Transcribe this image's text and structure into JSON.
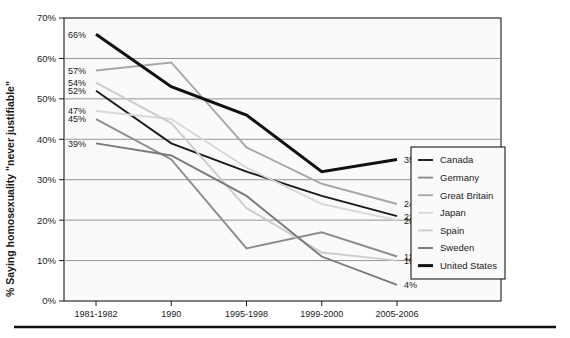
{
  "chart_data": {
    "type": "line",
    "title": "",
    "xlabel": "",
    "ylabel": "% Saying homosexuality \"never justifiable\"",
    "categories": [
      "1981-1982",
      "1990",
      "1995-1998",
      "1999-2000",
      "2005-2006"
    ],
    "ylim": [
      0,
      70
    ],
    "ytick_labels": [
      "0%",
      "10%",
      "20%",
      "30%",
      "40%",
      "50%",
      "60%",
      "70%"
    ],
    "ytick_values": [
      0,
      10,
      20,
      30,
      40,
      50,
      60,
      70
    ],
    "grid": true,
    "legend_position": "right-inside",
    "series": [
      {
        "name": "Canada",
        "color": "#1a1a1a",
        "width": 1.9,
        "values": [
          52,
          39,
          32,
          26,
          21
        ],
        "start_label": "52%",
        "end_label": "21%"
      },
      {
        "name": "Germany",
        "color": "#8c8c8c",
        "width": 1.9,
        "values": [
          45,
          35,
          13,
          17,
          11
        ],
        "start_label": "45%",
        "end_label": "11%"
      },
      {
        "name": "Great Britain",
        "color": "#a8a8a8",
        "width": 1.9,
        "values": [
          57,
          59,
          38,
          29,
          24
        ],
        "start_label": "57%",
        "end_label": "24%"
      },
      {
        "name": "Japan",
        "color": "#d8d8d8",
        "width": 1.9,
        "values": [
          47,
          45,
          33,
          24,
          20
        ],
        "start_label": "47%",
        "end_label": "20%"
      },
      {
        "name": "Spain",
        "color": "#cccccc",
        "width": 1.9,
        "values": [
          54,
          44,
          23,
          12,
          10
        ],
        "start_label": "54%",
        "end_label": "10%"
      },
      {
        "name": "Sweden",
        "color": "#7a7a7a",
        "width": 1.9,
        "values": [
          39,
          36,
          26,
          11,
          4
        ],
        "start_label": "39%",
        "end_label": "4%"
      },
      {
        "name": "United States",
        "color": "#111111",
        "width": 3.0,
        "values": [
          66,
          53,
          46,
          32,
          35
        ],
        "start_label": "66%",
        "end_label": "35%"
      }
    ],
    "start_labels_order": [
      "66%",
      "57%",
      "54%",
      "52%",
      "47%",
      "45%",
      "39%"
    ],
    "end_labels_order": [
      "35%",
      "24%",
      "21%",
      "20%",
      "11%",
      "10%",
      "4%"
    ]
  },
  "legend": {
    "items": [
      {
        "label": "Canada"
      },
      {
        "label": "Germany"
      },
      {
        "label": "Great Britain"
      },
      {
        "label": "Japan"
      },
      {
        "label": "Spain"
      },
      {
        "label": "Sweden"
      },
      {
        "label": "United States"
      }
    ]
  }
}
